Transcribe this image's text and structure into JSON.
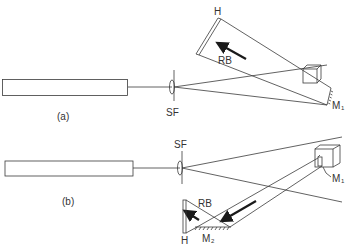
{
  "figure": {
    "type": "holography-setup-diagram",
    "panels": [
      {
        "id": "a",
        "caption": "(a)",
        "labels": {
          "spatial_filter": "SF",
          "hologram": "H",
          "reference_beam": "RB",
          "mirror1": "M",
          "mirror1_sub": "1"
        }
      },
      {
        "id": "b",
        "caption": "(b)",
        "labels": {
          "spatial_filter": "SF",
          "hologram": "H",
          "reference_beam": "RB",
          "mirror1": "M",
          "mirror1_sub": "1",
          "mirror2": "M",
          "mirror2_sub": "2"
        }
      }
    ],
    "colors": {
      "line": "#3a3a3a",
      "arrow": "#1a1a1a",
      "background": "#ffffff"
    }
  }
}
